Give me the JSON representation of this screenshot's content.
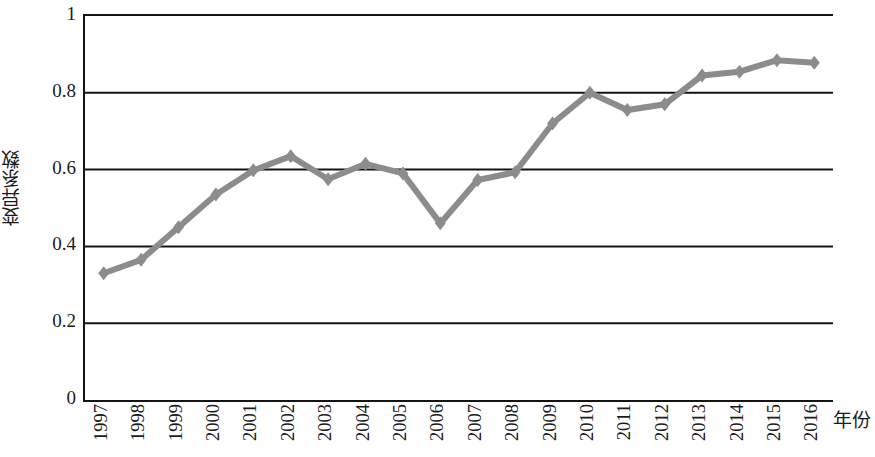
{
  "chart_data": {
    "type": "line",
    "title": "",
    "xlabel": "年份",
    "ylabel": "变异系数",
    "xlim": [
      1996.5,
      2016.5
    ],
    "ylim": [
      0,
      1
    ],
    "grid": true,
    "grid_axis": "y",
    "legend": false,
    "legend_position": "none",
    "marker": "diamond",
    "series_color": "#8c8c8c",
    "axis_color": "#141414",
    "categories": [
      "1997",
      "1998",
      "1999",
      "2000",
      "2001",
      "2002",
      "2003",
      "2004",
      "2005",
      "2006",
      "2007",
      "2008",
      "2009",
      "2010",
      "2011",
      "2012",
      "2013",
      "2014",
      "2015",
      "2016"
    ],
    "x": [
      1997,
      1998,
      1999,
      2000,
      2001,
      2002,
      2003,
      2004,
      2005,
      2006,
      2007,
      2008,
      2009,
      2010,
      2011,
      2012,
      2013,
      2014,
      2015,
      2016
    ],
    "values": [
      0.33,
      0.365,
      0.45,
      0.535,
      0.598,
      0.635,
      0.575,
      0.615,
      0.59,
      0.46,
      0.573,
      0.593,
      0.72,
      0.8,
      0.755,
      0.77,
      0.845,
      0.855,
      0.885,
      0.878
    ],
    "series": [
      {
        "name": "变异系数",
        "values": [
          0.33,
          0.365,
          0.45,
          0.535,
          0.598,
          0.635,
          0.575,
          0.615,
          0.59,
          0.46,
          0.573,
          0.593,
          0.72,
          0.8,
          0.755,
          0.77,
          0.845,
          0.855,
          0.885,
          0.878
        ]
      }
    ],
    "yticks": [
      0,
      0.2,
      0.4,
      0.6,
      0.8,
      1
    ],
    "ytick_labels": [
      "0",
      "0.2",
      "0.4",
      "0.6",
      "0.8",
      "1"
    ],
    "xtick_labels": [
      "1997",
      "1998",
      "1999",
      "2000",
      "2001",
      "2002",
      "2003",
      "2004",
      "2005",
      "2006",
      "2007",
      "2008",
      "2009",
      "2010",
      "2011",
      "2012",
      "2013",
      "2014",
      "2015",
      "2016"
    ]
  },
  "axes": {
    "y_title": "变异系数",
    "x_title": "年份"
  }
}
